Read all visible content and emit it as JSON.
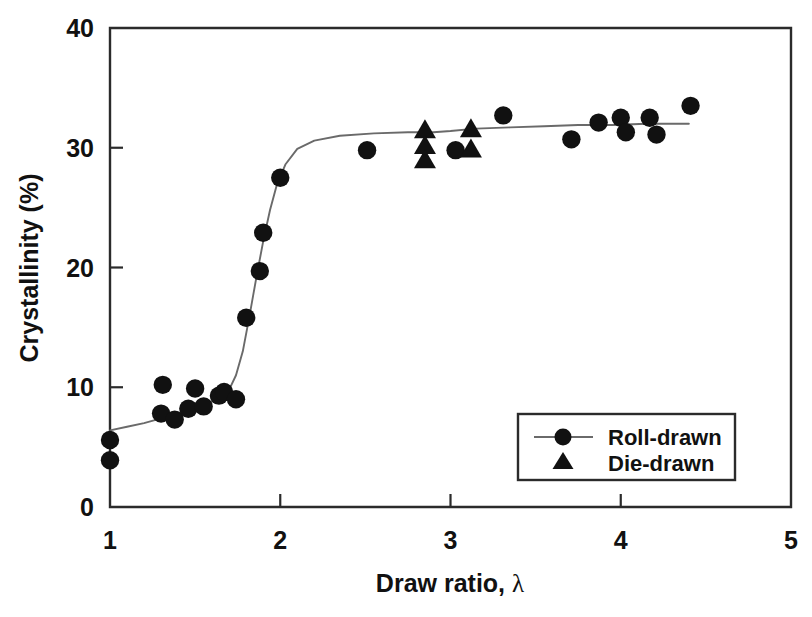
{
  "chart_data": {
    "type": "scatter",
    "title": "",
    "xlabel": "Draw ratio, λ",
    "ylabel": "Crystallinity (%)",
    "xlim": [
      1,
      5
    ],
    "ylim": [
      0,
      40
    ],
    "xticks": [
      "1",
      "2",
      "3",
      "4",
      "5"
    ],
    "xtick_values": [
      1,
      2,
      3,
      4,
      5
    ],
    "yticks": [
      "0",
      "10",
      "20",
      "30",
      "40"
    ],
    "ytick_values": [
      0,
      10,
      20,
      30,
      40
    ],
    "grid": false,
    "legend_position": "lower-right",
    "series": [
      {
        "name": "Roll-drawn",
        "marker": "circle",
        "has_line": true,
        "color": "#111111",
        "points": [
          [
            1.0,
            5.6
          ],
          [
            1.0,
            3.9
          ],
          [
            1.3,
            7.8
          ],
          [
            1.31,
            10.2
          ],
          [
            1.38,
            7.3
          ],
          [
            1.46,
            8.2
          ],
          [
            1.5,
            9.9
          ],
          [
            1.55,
            8.4
          ],
          [
            1.64,
            9.3
          ],
          [
            1.67,
            9.6
          ],
          [
            1.74,
            9.0
          ],
          [
            1.8,
            15.8
          ],
          [
            1.88,
            19.7
          ],
          [
            1.9,
            22.9
          ],
          [
            2.0,
            27.5
          ],
          [
            2.51,
            29.8
          ],
          [
            3.03,
            29.8
          ],
          [
            3.31,
            32.7
          ],
          [
            3.71,
            30.7
          ],
          [
            3.87,
            32.1
          ],
          [
            4.0,
            32.5
          ],
          [
            4.03,
            31.3
          ],
          [
            4.17,
            32.5
          ],
          [
            4.21,
            31.1
          ],
          [
            4.41,
            33.5
          ]
        ]
      },
      {
        "name": "Die-drawn",
        "marker": "triangle",
        "has_line": false,
        "color": "#111111",
        "points": [
          [
            2.85,
            31.5
          ],
          [
            2.85,
            30.2
          ],
          [
            2.85,
            29.0
          ],
          [
            3.12,
            31.6
          ],
          [
            3.12,
            29.9
          ]
        ]
      }
    ],
    "fit_curve": {
      "name": "sigmoidal-fit",
      "points": [
        [
          1.0,
          6.4
        ],
        [
          1.1,
          6.7
        ],
        [
          1.2,
          7.0
        ],
        [
          1.3,
          7.4
        ],
        [
          1.4,
          7.8
        ],
        [
          1.5,
          8.3
        ],
        [
          1.58,
          8.7
        ],
        [
          1.65,
          9.2
        ],
        [
          1.7,
          9.8
        ],
        [
          1.74,
          11.0
        ],
        [
          1.78,
          13.0
        ],
        [
          1.82,
          16.0
        ],
        [
          1.86,
          19.2
        ],
        [
          1.9,
          22.2
        ],
        [
          1.94,
          24.8
        ],
        [
          1.98,
          26.9
        ],
        [
          2.03,
          28.6
        ],
        [
          2.1,
          29.9
        ],
        [
          2.2,
          30.6
        ],
        [
          2.35,
          31.0
        ],
        [
          2.55,
          31.2
        ],
        [
          2.75,
          31.3
        ],
        [
          2.9,
          31.3
        ],
        [
          3.0,
          31.4
        ],
        [
          3.15,
          31.6
        ],
        [
          3.35,
          31.7
        ],
        [
          3.55,
          31.8
        ],
        [
          3.75,
          31.9
        ],
        [
          3.95,
          31.9
        ],
        [
          4.15,
          32.0
        ],
        [
          4.4,
          32.0
        ]
      ]
    }
  },
  "legend": {
    "entries": [
      {
        "label": "Roll-drawn",
        "marker": "circle",
        "has_line": true
      },
      {
        "label": "Die-drawn",
        "marker": "triangle",
        "has_line": false
      }
    ]
  },
  "colors": {
    "axis": "#2b2b2b",
    "marker": "#111111",
    "curve": "#6a6a6a",
    "background": "#ffffff"
  }
}
